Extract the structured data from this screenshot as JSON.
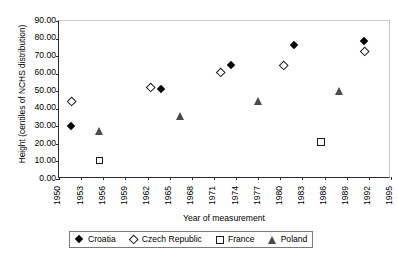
{
  "chart_data": {
    "type": "scatter",
    "title": "",
    "xlabel": "Year of measurement",
    "ylabel": "Height (centiles of NCHS distribution)",
    "xlim": [
      1950,
      1995
    ],
    "ylim": [
      0,
      90
    ],
    "ytick_labels": [
      "90.00",
      "80.00",
      "70.00",
      "60.00",
      "50.00",
      "40.00",
      "30.00",
      "20.00",
      "10.00",
      "0.00"
    ],
    "ytick_values": [
      90,
      80,
      70,
      60,
      50,
      40,
      30,
      20,
      10,
      0
    ],
    "xtick_labels": [
      "1950",
      "1953",
      "1956",
      "1959",
      "1962",
      "1965",
      "1968",
      "1971",
      "1974",
      "1977",
      "1980",
      "1983",
      "1986",
      "1989",
      "1992",
      "1995"
    ],
    "xtick_values": [
      1950,
      1953,
      1956,
      1959,
      1962,
      1965,
      1968,
      1971,
      1974,
      1977,
      1980,
      1983,
      1986,
      1989,
      1992,
      1995
    ],
    "grid": false,
    "legend_position": "bottom",
    "series": [
      {
        "name": "Croatia",
        "marker": "filled-diamond",
        "color": "#000000",
        "points": [
          {
            "x": 1951.8,
            "y": 29.5
          },
          {
            "x": 1964.0,
            "y": 50.5
          },
          {
            "x": 1973.5,
            "y": 64.5
          },
          {
            "x": 1982.0,
            "y": 75.5
          },
          {
            "x": 1991.5,
            "y": 78.0
          }
        ]
      },
      {
        "name": "Czech Republic",
        "marker": "open-diamond",
        "color": "#1a1a1a",
        "points": [
          {
            "x": 1951.8,
            "y": 44.0
          },
          {
            "x": 1962.5,
            "y": 51.5
          },
          {
            "x": 1972.0,
            "y": 60.0
          },
          {
            "x": 1980.5,
            "y": 64.5
          },
          {
            "x": 1991.5,
            "y": 72.5
          }
        ]
      },
      {
        "name": "France",
        "marker": "open-square",
        "color": "#1a1a1a",
        "points": [
          {
            "x": 1955.5,
            "y": 10.5
          },
          {
            "x": 1985.5,
            "y": 21.0
          }
        ]
      },
      {
        "name": "Poland",
        "marker": "filled-triangle",
        "color": "#4a4a4a",
        "points": [
          {
            "x": 1955.5,
            "y": 27.5
          },
          {
            "x": 1966.5,
            "y": 35.5
          },
          {
            "x": 1977.0,
            "y": 44.5
          },
          {
            "x": 1988.0,
            "y": 50.0
          }
        ]
      }
    ]
  },
  "legend": {
    "items": [
      {
        "label": "Croatia",
        "marker": "filled-diamond"
      },
      {
        "label": "Czech Republic",
        "marker": "open-diamond"
      },
      {
        "label": "France",
        "marker": "open-square"
      },
      {
        "label": "Poland",
        "marker": "filled-triangle"
      }
    ]
  }
}
